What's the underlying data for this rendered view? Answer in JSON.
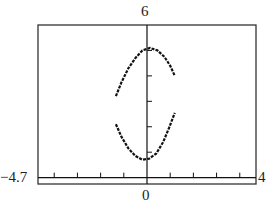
{
  "chart_data": {
    "type": "line",
    "title": "",
    "xlabel": "",
    "ylabel": "",
    "xlim": [
      -4.7,
      4.7
    ],
    "ylim": [
      -0.25,
      6
    ],
    "grid": false,
    "legend": null,
    "tick_labels": {
      "y_top": "6",
      "x_left": "-4.7",
      "x_right": "4.7",
      "x_origin": "0"
    },
    "x_tick_step": 1,
    "y_tick_step": 1,
    "series": [
      {
        "name": "upper branch",
        "x": [
          -1.34,
          -1.1,
          -0.8,
          -0.5,
          -0.2,
          0.13,
          0.45,
          0.75,
          1.0,
          1.2
        ],
        "y": [
          3.2,
          3.75,
          4.3,
          4.7,
          5.0,
          5.1,
          5.0,
          4.75,
          4.4,
          4.0
        ]
      },
      {
        "name": "lower branch",
        "x": [
          -1.34,
          -1.1,
          -0.8,
          -0.5,
          -0.2,
          0.1,
          0.4,
          0.7,
          0.95,
          1.2
        ],
        "y": [
          2.1,
          1.6,
          1.15,
          0.85,
          0.7,
          0.75,
          0.95,
          1.4,
          1.95,
          2.55
        ]
      }
    ],
    "annotations": []
  },
  "labels": {
    "y_top": "6",
    "x_left": "−4.7",
    "x_right": "4",
    "x_origin": "0"
  },
  "style": {
    "stroke": "#111111",
    "frame": "#333333",
    "background": "#ffffff"
  }
}
